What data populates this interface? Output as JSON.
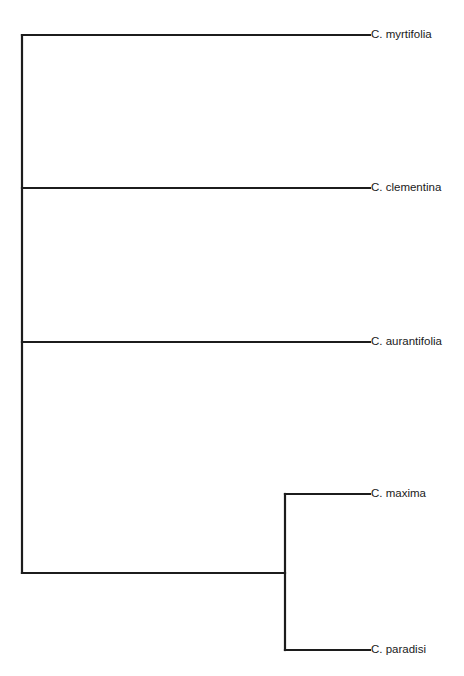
{
  "diagram": {
    "type": "phylogenetic-tree",
    "orientation": "left-to-right",
    "colors": {
      "line": "#1c1c1c",
      "text": "#1a1a1a",
      "background": "#ffffff"
    },
    "leaves": [
      {
        "id": "myrtifolia",
        "label": "C. myrtifolia",
        "y": 35
      },
      {
        "id": "clementina",
        "label": "C. clementina",
        "y": 188
      },
      {
        "id": "aurantifolia",
        "label": "C. aurantifolia",
        "y": 342
      },
      {
        "id": "maxima",
        "label": "C. maxima",
        "y": 494
      },
      {
        "id": "paradisi",
        "label": "C. paradisi",
        "y": 650
      }
    ],
    "nodes": [
      {
        "id": "root",
        "x": 22,
        "y_top": 35,
        "y_bottom": 573,
        "children": [
          "myrtifolia",
          "clementina",
          "aurantifolia",
          "maxima_paradisi"
        ]
      },
      {
        "id": "maxima_paradisi",
        "x": 285,
        "y_top": 494,
        "y_bottom": 650,
        "stem_y": 573,
        "children": [
          "maxima",
          "paradisi"
        ]
      }
    ],
    "tip_x": 370
  }
}
